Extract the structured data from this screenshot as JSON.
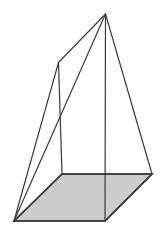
{
  "figure": {
    "name": "oblique-pyramid-wireframe",
    "canvas": {
      "width": 164,
      "height": 236,
      "background": "#ffffff"
    },
    "style": {
      "stroke_color": "#3a3a3a",
      "stroke_width": 1.2,
      "base_stroke_width": 1.6,
      "base_fill": "#cccccc"
    },
    "vertices": {
      "apex": {
        "label": "apex",
        "x": 105.5,
        "y": 14.0
      },
      "back_top": {
        "label": "back-top",
        "x": 58.5,
        "y": 62.5
      },
      "base_left": {
        "label": "base-left",
        "x": 14.0,
        "y": 221.0
      },
      "base_back": {
        "label": "base-back",
        "x": 62.0,
        "y": 174.0
      },
      "base_right": {
        "label": "base-right",
        "x": 152.0,
        "y": 174.0
      },
      "base_front": {
        "label": "base-front",
        "x": 105.0,
        "y": 221.0
      }
    },
    "base_polygon_points": "14,221 62,174 152,174 105,221",
    "edges": [
      {
        "name": "apex-to-back-top",
        "d": "M 105.5 14 L 58.5 62.5"
      },
      {
        "name": "apex-to-base-left",
        "d": "M 105.5 14 L 14 221"
      },
      {
        "name": "apex-to-base-front",
        "d": "M 105.5 14 L 105 221"
      },
      {
        "name": "apex-to-base-right",
        "d": "M 105.5 14 L 152 174"
      },
      {
        "name": "back-top-to-base-left",
        "d": "M 58.5 62.5 L 14 221"
      },
      {
        "name": "back-top-to-base-back",
        "d": "M 58.5 62.5 L 62 174"
      }
    ],
    "base_edges": [
      {
        "name": "base-edge-left-back",
        "d": "M 14 221 L 62 174"
      },
      {
        "name": "base-edge-back-right",
        "d": "M 62 174 L 152 174"
      },
      {
        "name": "base-edge-right-front",
        "d": "M 152 174 L 105 221"
      },
      {
        "name": "base-edge-front-left",
        "d": "M 105 221 L 14 221"
      }
    ]
  }
}
